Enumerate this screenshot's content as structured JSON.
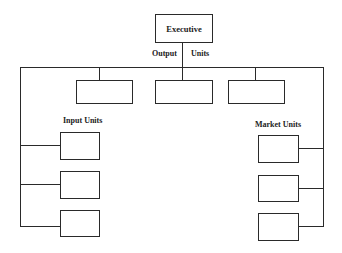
{
  "diagram": {
    "executive": {
      "label": "Executive"
    },
    "labels": {
      "output": "Output",
      "units": "Units",
      "input_units": "Input  Units",
      "market_units": "Market  Units"
    },
    "output_units": [
      {
        "label": ""
      },
      {
        "label": ""
      },
      {
        "label": ""
      }
    ],
    "input_units": [
      {
        "label": ""
      },
      {
        "label": ""
      },
      {
        "label": ""
      }
    ],
    "market_units": [
      {
        "label": ""
      },
      {
        "label": ""
      },
      {
        "label": ""
      }
    ]
  }
}
